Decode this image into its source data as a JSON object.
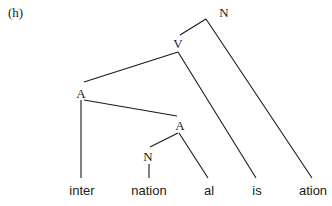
{
  "figure": {
    "tag": "(h)"
  },
  "tree": {
    "nodes": [
      {
        "id": "n_root",
        "label": "N",
        "x": 224,
        "y": 12
      },
      {
        "id": "v",
        "label": "V",
        "x": 178,
        "y": 43
      },
      {
        "id": "a_upper",
        "label": "A",
        "x": 81,
        "y": 93
      },
      {
        "id": "a_lower",
        "label": "A",
        "x": 180,
        "y": 125
      },
      {
        "id": "n_lower",
        "label": "N",
        "x": 148,
        "y": 156
      }
    ],
    "leaves": [
      {
        "id": "inter",
        "label": "inter",
        "x": 82,
        "y": 190
      },
      {
        "id": "nation",
        "label": "nation",
        "x": 149,
        "y": 190
      },
      {
        "id": "al",
        "label": "al",
        "x": 209,
        "y": 190
      },
      {
        "id": "is",
        "label": "is",
        "x": 257,
        "y": 190
      },
      {
        "id": "ation",
        "label": "ation",
        "x": 313,
        "y": 190
      }
    ],
    "edges": [
      {
        "from": "N",
        "to": "V",
        "x1": 206,
        "y1": 19,
        "x2": 180,
        "y2": 35
      },
      {
        "from": "N",
        "to": "ation",
        "x1": 206,
        "y1": 19,
        "x2": 312,
        "y2": 178
      },
      {
        "from": "V",
        "to": "A",
        "x1": 178,
        "y1": 52,
        "x2": 84,
        "y2": 82
      },
      {
        "from": "V",
        "to": "is",
        "x1": 178,
        "y1": 52,
        "x2": 256,
        "y2": 178
      },
      {
        "from": "A",
        "to": "inter",
        "x1": 81,
        "y1": 100,
        "x2": 81,
        "y2": 178
      },
      {
        "from": "A",
        "to": "A",
        "x1": 84,
        "y1": 100,
        "x2": 177,
        "y2": 116
      },
      {
        "from": "A",
        "to": "N",
        "x1": 178,
        "y1": 133,
        "x2": 150,
        "y2": 147
      },
      {
        "from": "A",
        "to": "al",
        "x1": 179,
        "y1": 133,
        "x2": 208,
        "y2": 178
      },
      {
        "from": "N",
        "to": "nation",
        "x1": 149,
        "y1": 164,
        "x2": 149,
        "y2": 178
      }
    ],
    "line_color": "#1a1a1a"
  }
}
